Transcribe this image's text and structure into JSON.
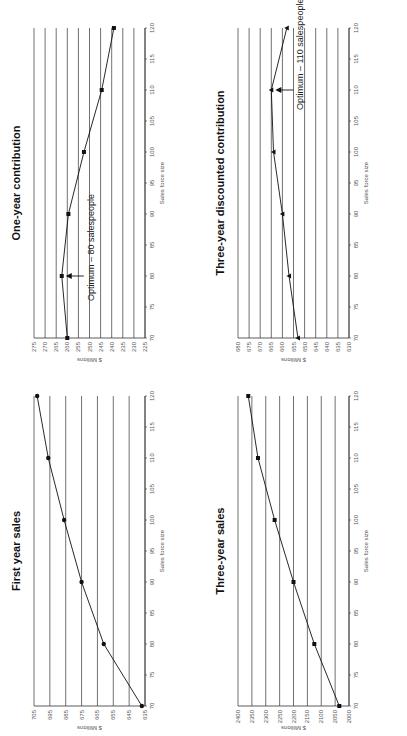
{
  "chart_data": [
    {
      "id": "first_year_sales",
      "type": "line",
      "title": "First year sales",
      "xlabel": "Sales force size",
      "ylabel": "$ Millions",
      "x": [
        70,
        80,
        90,
        100,
        110,
        120
      ],
      "series": [
        {
          "name": "First year sales",
          "values": [
            637,
            661,
            675,
            686,
            696,
            703
          ]
        }
      ],
      "xticks": [
        70,
        75,
        80,
        85,
        90,
        95,
        100,
        105,
        110,
        115,
        120
      ],
      "yticks": [
        635,
        645,
        655,
        665,
        675,
        685,
        695,
        705
      ],
      "xlim": [
        70,
        120
      ],
      "ylim": [
        635,
        705
      ],
      "grid": "horizontal",
      "marker": "circle",
      "annotation": null
    },
    {
      "id": "one_year_contribution",
      "type": "line",
      "title": "One-year contribution",
      "xlabel": "Sales force size",
      "ylabel": "$ Millions",
      "x": [
        70,
        80,
        90,
        100,
        110,
        120
      ],
      "series": [
        {
          "name": "One-year contribution",
          "values": [
            260,
            262.5,
            259.5,
            252.5,
            244.5,
            239
          ]
        }
      ],
      "xticks": [
        70,
        75,
        80,
        85,
        90,
        95,
        100,
        105,
        110,
        115,
        120
      ],
      "yticks": [
        225,
        230,
        235,
        240,
        245,
        250,
        255,
        260,
        265,
        270,
        275
      ],
      "xlim": [
        70,
        120
      ],
      "ylim": [
        225,
        275
      ],
      "grid": "horizontal",
      "marker": "square",
      "annotation": {
        "text": "Optimum – 80 salespeople",
        "x": 80
      }
    },
    {
      "id": "three_year_sales",
      "type": "line",
      "title": "Three-year sales",
      "xlabel": "Sales force size",
      "ylabel": "$ Millions",
      "x": [
        70,
        80,
        90,
        100,
        110,
        120
      ],
      "series": [
        {
          "name": "Three-year sales",
          "values": [
            2035,
            2125,
            2200,
            2268,
            2328,
            2363
          ]
        }
      ],
      "xticks": [
        70,
        75,
        80,
        85,
        90,
        95,
        100,
        105,
        110,
        115,
        120
      ],
      "yticks": [
        2000,
        2050,
        2100,
        2150,
        2200,
        2250,
        2300,
        2350,
        2400
      ],
      "xlim": [
        70,
        120
      ],
      "ylim": [
        2000,
        2400
      ],
      "grid": "horizontal",
      "marker": "square",
      "annotation": null
    },
    {
      "id": "three_year_discounted_contribution",
      "type": "line",
      "title": "Three-year discounted contribution",
      "xlabel": "Sales force size",
      "ylabel": "$ Millions",
      "x": [
        70,
        80,
        90,
        100,
        110,
        120
      ],
      "series": [
        {
          "name": "Three-year discounted contribution",
          "values": [
            653,
            657,
            660,
            664,
            665,
            658
          ]
        }
      ],
      "xticks": [
        70,
        75,
        80,
        85,
        90,
        95,
        100,
        105,
        110,
        115,
        120
      ],
      "yticks": [
        630,
        635,
        640,
        645,
        650,
        655,
        660,
        665,
        670,
        675,
        680
      ],
      "xlim": [
        70,
        120
      ],
      "ylim": [
        630,
        680
      ],
      "grid": "horizontal",
      "marker": "triangle",
      "annotation": {
        "text": "Optimum – 110 salespeople",
        "x": 110
      }
    }
  ],
  "layout": {
    "positions": {
      "first_year_sales": [
        0,
        0
      ],
      "one_year_contribution": [
        368,
        0
      ],
      "three_year_sales": [
        0,
        204
      ],
      "three_year_discounted_contribution": [
        368,
        204
      ]
    }
  }
}
